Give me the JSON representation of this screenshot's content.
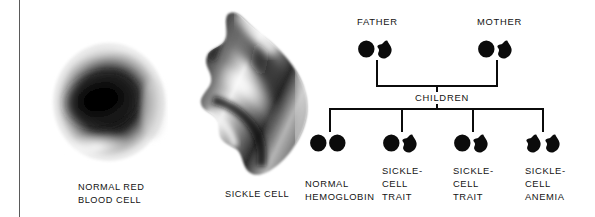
{
  "figure": {
    "background_color": "#ffffff",
    "ink_color": "#0b0b0b"
  },
  "cells_panel": {
    "normal_cell": {
      "caption": "NORMAL RED\nBLOOD CELL",
      "art_name": "normal-red-blood-cell-micrograph",
      "shape": "biconcave-disc"
    },
    "sickle_cell": {
      "caption": "SICKLE CELL",
      "art_name": "sickle-cell-micrograph",
      "shape": "crescent-sickle"
    }
  },
  "pedigree": {
    "parents": [
      {
        "label": "FATHER",
        "symbols": [
          "circle",
          "sickle"
        ],
        "genotype": "carrier"
      },
      {
        "label": "MOTHER",
        "symbols": [
          "circle",
          "sickle"
        ],
        "genotype": "carrier"
      }
    ],
    "children_label": "CHILDREN",
    "children": [
      {
        "label": "NORMAL\nHEMOGLOBIN",
        "symbols": [
          "circle",
          "circle"
        ]
      },
      {
        "label": "SICKLE-\nCELL\nTRAIT",
        "symbols": [
          "circle",
          "sickle"
        ]
      },
      {
        "label": "SICKLE-\nCELL\nTRAIT",
        "symbols": [
          "circle",
          "sickle"
        ]
      },
      {
        "label": "SICKLE-\nCELL\nANEMIA",
        "symbols": [
          "sickle",
          "sickle"
        ]
      }
    ]
  }
}
